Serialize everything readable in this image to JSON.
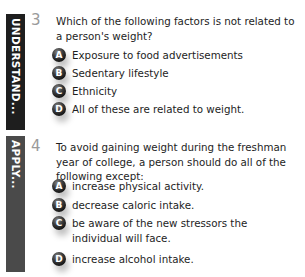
{
  "sections": [
    {
      "label": "UNDERSTAND...",
      "bar_color": "#1e1e1e",
      "question": {
        "number": "3",
        "stem": "Which of the following factors is not related to a person's weight?",
        "options": [
          {
            "letter": "A",
            "text": "Exposure to food advertisements"
          },
          {
            "letter": "B",
            "text": "Sedentary lifestyle"
          },
          {
            "letter": "C",
            "text": "Ethnicity"
          },
          {
            "letter": "D",
            "text": "All of these are related to weight."
          }
        ]
      }
    },
    {
      "label": "APPLY...",
      "bar_color": "#4a4a4a",
      "question": {
        "number": "4",
        "stem": "To avoid gaining weight during the freshman year of college, a person should do all of the following except:",
        "options": [
          {
            "letter": "A",
            "text": "increase physical activity."
          },
          {
            "letter": "B",
            "text": "decrease caloric intake."
          },
          {
            "letter": "C",
            "text": "be aware of the new stressors the individual will face."
          },
          {
            "letter": "D",
            "text": "increase alcohol intake."
          }
        ]
      }
    }
  ]
}
